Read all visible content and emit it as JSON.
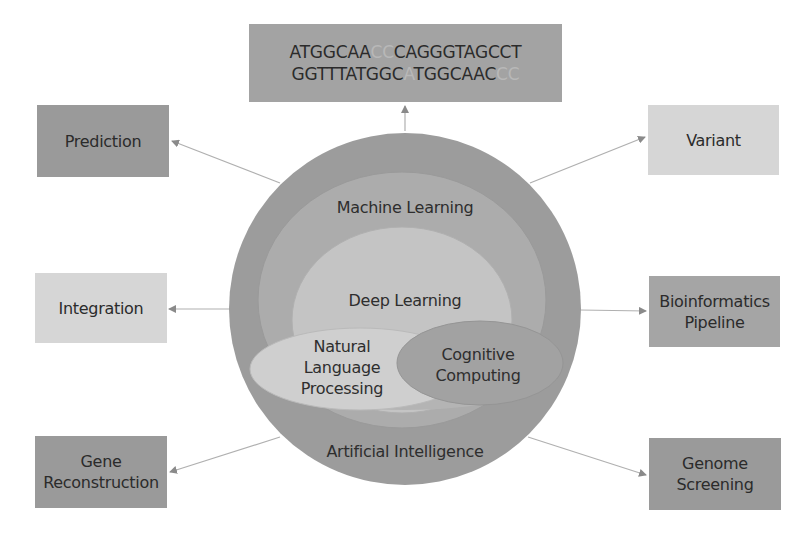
{
  "dna_box": {
    "line1": [
      "ATGGCAA",
      "CC",
      "CAGGGTAGCCT"
    ],
    "line2": [
      "GGTTTATGGC",
      "A",
      "TGGCAAC",
      "CC"
    ]
  },
  "circles": {
    "outer": "Artificial Intelligence",
    "middle": "Machine Learning",
    "inner": "Deep Learning",
    "nlp": [
      "Natural",
      "Language",
      "Processing"
    ],
    "cognitive": [
      "Cognitive",
      "Computing"
    ]
  },
  "left_boxes": [
    {
      "label": "Prediction",
      "shade": "dark"
    },
    {
      "label": "Integration",
      "shade": "light"
    },
    {
      "label": "Gene Reconstruction",
      "lines": [
        "Gene",
        "Reconstruction"
      ],
      "shade": "dark"
    }
  ],
  "right_boxes": [
    {
      "label": "Variant",
      "shade": "light"
    },
    {
      "label": "Bioinformatics Pipeline",
      "lines": [
        "Bioinformatics",
        "Pipeline"
      ],
      "shade": "mid"
    },
    {
      "label": "Genome Screening",
      "lines": [
        "Genome",
        "Screening"
      ],
      "shade": "dark"
    }
  ],
  "colors": {
    "outer_circle": "#9c9c9c",
    "ml_circle": "#acacac",
    "dl_circle": "#c4c4c4",
    "nlp_ellipse": "#cfcfcf",
    "cc_ellipse": "#a2a2a2",
    "arrow": "#a8a8a8"
  }
}
